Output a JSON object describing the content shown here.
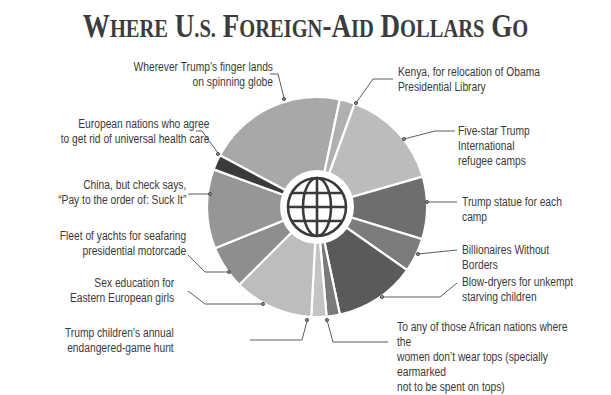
{
  "title": "Where U.S. Foreign-Aid Dollars Go",
  "chart_data": {
    "type": "pie",
    "variant": "donut",
    "title": "Where U.S. Foreign-Aid Dollars Go",
    "center_icon": "globe-icon",
    "slices": [
      {
        "label": "Wherever Trump's finger lands on spinning globe",
        "start_deg": -62,
        "end_deg": 12,
        "value": 20.6,
        "color": "#a8a8a8"
      },
      {
        "label": "Kenya, for relocation of Obama Presidential Library",
        "start_deg": 12,
        "end_deg": 20,
        "value": 2.2,
        "color": "#b0b0b0"
      },
      {
        "label": "Five-star Trump International refugee camps",
        "start_deg": 20,
        "end_deg": 74,
        "value": 15.0,
        "color": "#bcbcbc"
      },
      {
        "label": "Trump statue for each camp",
        "start_deg": 74,
        "end_deg": 107,
        "value": 9.2,
        "color": "#6e6e6e"
      },
      {
        "label": "Billionaires Without Borders",
        "start_deg": 107,
        "end_deg": 125,
        "value": 5.0,
        "color": "#7c7c7c"
      },
      {
        "label": "Blow-dryers for unkempt starving children",
        "start_deg": 125,
        "end_deg": 168,
        "value": 11.9,
        "color": "#5a5a5a"
      },
      {
        "label": "To any of those African nations where the women don't wear tops (specially earmarked not to be spent on tops)",
        "start_deg": 168,
        "end_deg": 175,
        "value": 1.9,
        "color": "#7a7a7a"
      },
      {
        "label": "Trump children's annual endangered-game hunt",
        "start_deg": 175,
        "end_deg": 183,
        "value": 2.2,
        "color": "#c4c4c4"
      },
      {
        "label": "Sex education for Eastern European girls",
        "start_deg": 183,
        "end_deg": 225,
        "value": 11.7,
        "color": "#bdbdbd"
      },
      {
        "label": "Fleet of yachts for seafaring presidential motorcade",
        "start_deg": 225,
        "end_deg": 248,
        "value": 6.4,
        "color": "#8e8e8e"
      },
      {
        "label": "China, but check says, “Pay to the order of: Suck It”",
        "start_deg": 248,
        "end_deg": 290,
        "value": 11.7,
        "color": "#969696"
      },
      {
        "label": "European nations who agree to get rid of universal health care",
        "start_deg": 290,
        "end_deg": 298,
        "value": 2.2,
        "color": "#3a3a3a"
      }
    ],
    "legend_position": "callouts around pie",
    "grid": false
  },
  "labels": {
    "wherever": "Wherever Trump’s finger lands\non spinning globe",
    "european": "European nations who agree\nto get rid of universal health care",
    "china": "China, but check says,\n“Pay to the order of: Suck It”",
    "yachts": "Fleet of yachts for seafaring\npresidential motorcade",
    "sexed": "Sex education for\nEastern European girls",
    "children": "Trump children’s annual\nendangered-game hunt",
    "kenya": "Kenya, for relocation of Obama\nPresidential Library",
    "fivestar": "Five-star Trump International\nrefugee camps",
    "statue": "Trump statue for each camp",
    "billionaires": "Billionaires Without Borders",
    "blowdryers": "Blow-dryers for unkempt\nstarving children",
    "african": "To any of those African nations where the\nwomen don’t wear tops (specially earmarked\nnot to be spent on tops)"
  }
}
